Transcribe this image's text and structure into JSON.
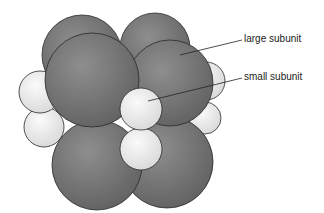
{
  "diagram": {
    "labels": {
      "large": "large subunit",
      "small": "small subunit"
    },
    "colors": {
      "large_fill_light": "#9a9a9a",
      "large_fill_dark": "#626262",
      "small_fill_light": "#ffffff",
      "small_fill_dark": "#d8d8d8",
      "outline": "#2a2a2a"
    }
  }
}
